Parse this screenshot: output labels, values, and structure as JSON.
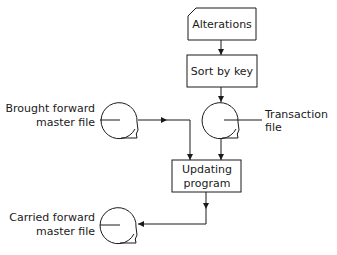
{
  "diagram": {
    "type": "flowchart",
    "title": "",
    "nodes": {
      "alterations": {
        "label": "Alterations",
        "shape": "punched-card"
      },
      "sort": {
        "label": "Sort by key",
        "shape": "process-box"
      },
      "transaction_file": {
        "label_line1": "Transaction",
        "label_line2": "file",
        "shape": "magnetic-tape"
      },
      "brought_forward": {
        "label_line1": "Brought forward",
        "label_line2": "master file",
        "shape": "magnetic-tape"
      },
      "updating": {
        "label_line1": "Updating",
        "label_line2": "program",
        "shape": "process-box"
      },
      "carried_forward": {
        "label_line1": "Carried forward",
        "label_line2": "master file",
        "shape": "magnetic-tape"
      }
    },
    "edges": [
      {
        "from": "Alterations",
        "to": "Sort by key"
      },
      {
        "from": "Sort by key",
        "to": "Transaction file"
      },
      {
        "from": "Transaction file",
        "to": "Updating program"
      },
      {
        "from": "Brought forward master file",
        "to": "Updating program"
      },
      {
        "from": "Updating program",
        "to": "Carried forward master file"
      }
    ],
    "colors": {
      "line": "#1a1a1a",
      "background": "#ffffff"
    }
  }
}
